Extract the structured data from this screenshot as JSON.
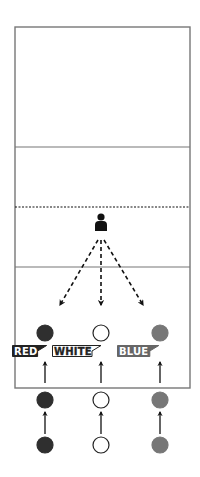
{
  "diagram": {
    "type": "volleyball-drill",
    "court": {
      "x": 15,
      "y": 27,
      "width": 175,
      "height": 361,
      "line_color": "#777777",
      "lines": [
        {
          "y": 147,
          "style": "solid"
        },
        {
          "y": 207,
          "style": "dotted"
        },
        {
          "y": 267,
          "style": "solid"
        }
      ]
    },
    "player": {
      "x": 101,
      "y": 222,
      "icon": "person-icon",
      "color": "#111111"
    },
    "passes": [
      {
        "from": [
          98,
          240
        ],
        "to": [
          60,
          305
        ]
      },
      {
        "from": [
          101,
          240
        ],
        "to": [
          101,
          305
        ]
      },
      {
        "from": [
          104,
          240
        ],
        "to": [
          143,
          305
        ]
      }
    ],
    "columns": [
      {
        "name": "red",
        "x": 45,
        "fill": "#2f2f2f",
        "stroke": "#2f2f2f"
      },
      {
        "name": "white",
        "x": 101,
        "fill": "#ffffff",
        "stroke": "#222222"
      },
      {
        "name": "blue",
        "x": 160,
        "fill": "#777777",
        "stroke": "#777777"
      }
    ],
    "ball_rows_y": [
      333,
      400,
      445
    ],
    "ball_radius": 8,
    "labels": [
      {
        "text": "RED",
        "x": 12,
        "y": 345,
        "style": "dark"
      },
      {
        "text": "WHITE",
        "x": 52,
        "y": 345,
        "style": "outline"
      },
      {
        "text": "BLUE",
        "x": 117,
        "y": 345,
        "style": "gray"
      }
    ]
  }
}
